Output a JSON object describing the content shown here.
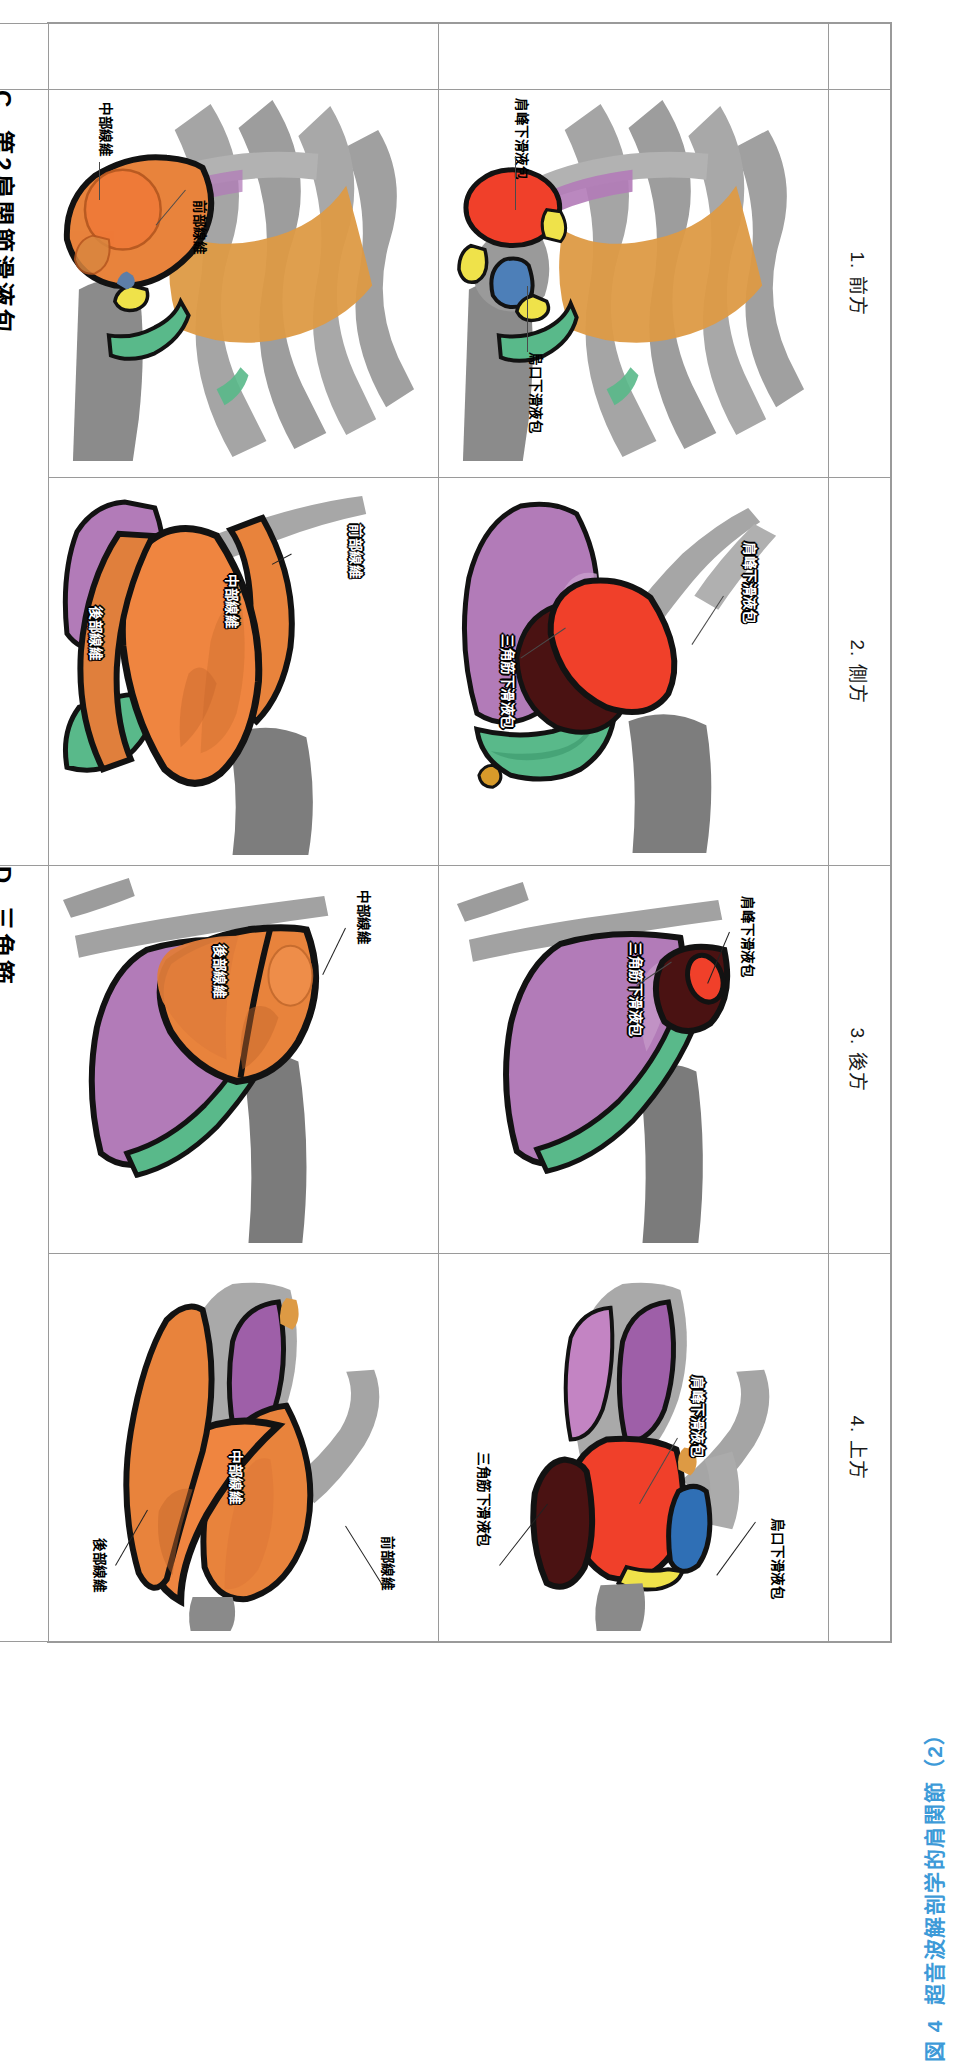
{
  "figure": {
    "caption_number": "図 4",
    "caption_text": "超音波解剖学的肩関節（2）",
    "caption_color": "#3d9ad8",
    "orientation": "page rotated 90 degrees clockwise in scan"
  },
  "table": {
    "column_headers": [
      {
        "id": "view-1",
        "label": "1. 前方"
      },
      {
        "id": "view-2",
        "label": "2. 側方"
      },
      {
        "id": "view-3",
        "label": "3. 後方"
      },
      {
        "id": "view-4",
        "label": "4. 上方"
      }
    ],
    "row_headers": [
      {
        "id": "row-c",
        "letter": "C",
        "label": "第2肩関節滑液包"
      },
      {
        "id": "row-d",
        "letter": "D",
        "label": "三角筋"
      }
    ]
  },
  "panels": {
    "c1": {
      "id": "C1",
      "row": "C",
      "view": "1. 前方",
      "annotations": [
        {
          "text": "肩峰下滑液包",
          "style": "outline-black"
        },
        {
          "text": "烏口下滑液包",
          "style": "outline-black"
        }
      ]
    },
    "c2": {
      "id": "C2",
      "row": "C",
      "view": "2. 側方",
      "annotations": [
        {
          "text": "肩峰下滑液包",
          "style": "white-stroke"
        },
        {
          "text": "三角筋下滑液包",
          "style": "white-stroke"
        }
      ]
    },
    "c3": {
      "id": "C3",
      "row": "C",
      "view": "3. 後方",
      "annotations": [
        {
          "text": "肩峰下滑液包",
          "style": "outline-black"
        },
        {
          "text": "三角筋下滑液包",
          "style": "white-stroke"
        }
      ]
    },
    "c4": {
      "id": "C4",
      "row": "C",
      "view": "4. 上方",
      "annotations": [
        {
          "text": "肩峰下滑液包",
          "style": "white-stroke"
        },
        {
          "text": "烏口下滑液包",
          "style": "outline-black"
        },
        {
          "text": "三角筋下滑液包",
          "style": "outline-black"
        }
      ]
    },
    "d1": {
      "id": "D1",
      "row": "D",
      "view": "1. 前方",
      "annotations": [
        {
          "text": "前部線維",
          "style": "outline-black"
        },
        {
          "text": "中部線維",
          "style": "outline-black"
        }
      ]
    },
    "d2": {
      "id": "D2",
      "row": "D",
      "view": "2. 側方",
      "annotations": [
        {
          "text": "前部線維",
          "style": "white-stroke"
        },
        {
          "text": "中部線維",
          "style": "white-stroke"
        },
        {
          "text": "後部線維",
          "style": "white-stroke"
        }
      ]
    },
    "d3": {
      "id": "D3",
      "row": "D",
      "view": "3. 後方",
      "annotations": [
        {
          "text": "中部線維",
          "style": "outline-black"
        },
        {
          "text": "後部線維",
          "style": "white-stroke"
        }
      ]
    },
    "d4": {
      "id": "D4",
      "row": "D",
      "view": "4. 上方",
      "annotations": [
        {
          "text": "前部線維",
          "style": "outline-black"
        },
        {
          "text": "中部線維",
          "style": "white-stroke"
        },
        {
          "text": "後部線維",
          "style": "outline-black"
        }
      ]
    }
  },
  "palette": {
    "bone_gray": "#9b9b9b",
    "bone_gray_dark": "#6e6e6e",
    "subacromial_bursa_red": "#f0402a",
    "subdeltoid_bursa_darkred": "#4a1212",
    "subcoracoid_bursa_blue": "#2f6fb5",
    "deltoid_orange": "#e8833c",
    "deltoid_orange_dark": "#c9642a",
    "infraspinatus_purple": "#b27bb8",
    "supraspinatus_purple_light": "#c79ccb",
    "teres_green": "#59b98a",
    "subscapularis_orange": "#dd9a44",
    "biceps_yellow": "#efe24a",
    "outline_black": "#121212",
    "table_border": "#9a9a9a"
  }
}
